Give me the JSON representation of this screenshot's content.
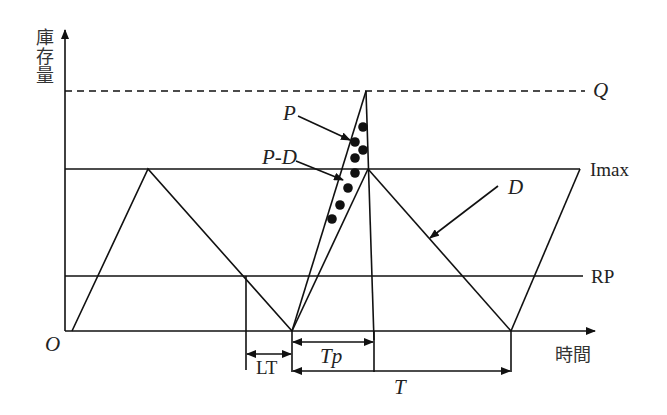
{
  "diagram": {
    "y_axis_label": "庫存量",
    "x_axis_label": "時間",
    "origin_label": "O",
    "levels": {
      "Q": "Q",
      "Imax": "Imax",
      "RP": "RP"
    },
    "rate_labels": {
      "production": "P",
      "production_minus_demand": "P-D",
      "demand": "D"
    },
    "intervals": {
      "lead_time": "LT",
      "production_time": "Tp",
      "cycle_time": "T"
    },
    "colors": {
      "line": "#111111",
      "background": "#ffffff",
      "text": "#222222"
    }
  }
}
